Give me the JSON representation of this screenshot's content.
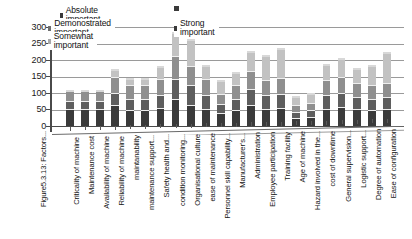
{
  "chart_data": {
    "type": "bar",
    "stacked": true,
    "title": "",
    "xlabel": "",
    "ylabel": "",
    "ylim": [
      0,
      300
    ],
    "yticks": [
      0,
      50,
      100,
      150,
      200,
      250,
      300
    ],
    "grid": true,
    "legend_position": "top-left",
    "caption": "Figure5.3.13: Factors...",
    "categories": [
      "Criticality of machine",
      "Maintenance cost",
      "Availability of machine",
      "Reliability of machine",
      "maintanability",
      "maintenance support...",
      "Safety health and...",
      "condition monitoring...",
      "Organisational culture",
      "ease of maintenance",
      "Personnel skill capability...",
      "Manufacturer's...",
      "Administration",
      "Employee participation",
      "Training facility",
      "Age of machine",
      "Hazard involved in the...",
      "cost of downtime",
      "General supervision...",
      "Logistic support...",
      "Degree of automation",
      "Ease of configuration"
    ],
    "series": [
      {
        "name": "Absolute important",
        "color": "#3a3a3a",
        "values": [
          48,
          48,
          48,
          62,
          45,
          45,
          52,
          78,
          62,
          50,
          35,
          45,
          62,
          50,
          52,
          22,
          25,
          50,
          55,
          48,
          45,
          48
        ]
      },
      {
        "name": "Demonostrated important",
        "color": "#8f8f8f",
        "values": [
          30,
          30,
          30,
          48,
          40,
          40,
          48,
          70,
          60,
          48,
          30,
          40,
          55,
          45,
          48,
          20,
          22,
          45,
          48,
          42,
          40,
          42
        ]
      },
      {
        "name": "Somewhat important",
        "color": "#5e5e5e",
        "values": [
          25,
          25,
          25,
          35,
          35,
          35,
          38,
          62,
          58,
          40,
          30,
          35,
          48,
          40,
          42,
          18,
          20,
          40,
          42,
          38,
          35,
          38
        ]
      },
      {
        "name": "Strong important",
        "color": "#c2c2c2",
        "values": [
          0,
          0,
          0,
          22,
          20,
          20,
          38,
          70,
          78,
          42,
          38,
          38,
          55,
          75,
          88,
          25,
          28,
          48,
          55,
          42,
          58,
          90
        ]
      }
    ],
    "totals": [
      103,
      103,
      103,
      167,
      140,
      140,
      176,
      280,
      258,
      180,
      133,
      158,
      220,
      210,
      230,
      85,
      95,
      183,
      200,
      170,
      178,
      218
    ]
  },
  "legend": {
    "items": [
      {
        "label": "Absolute important",
        "marker": "square-dark"
      },
      {
        "label": "Demonostrated important",
        "marker": "square-dark"
      },
      {
        "label": "Somewhat important",
        "marker": "square-light"
      },
      {
        "label": "Strong important",
        "marker": "square-dark"
      }
    ]
  }
}
